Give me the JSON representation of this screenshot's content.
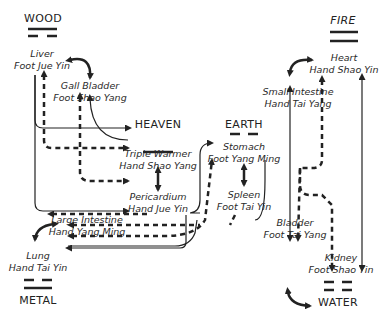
{
  "elements": {
    "wood": "WOOD",
    "fire": "FIRE",
    "heaven": "HEAVEN",
    "earth": "EARTH",
    "metal": "METAL",
    "water": "WATER"
  },
  "organs": {
    "liver": {
      "name": "Liver",
      "meridian": "Foot Jue Yin"
    },
    "gall_bladder": {
      "name": "Gall Bladder",
      "meridian": "Foot Shao Yang"
    },
    "triple_warmer": {
      "name": "Triple Warmer",
      "meridian": "Hand Shao Yang"
    },
    "pericardium": {
      "name": "Pericardium",
      "meridian": "Hand Jue Yin"
    },
    "stomach": {
      "name": "Stomach",
      "meridian": "Foot Yang Ming"
    },
    "spleen": {
      "name": "Spleen",
      "meridian": "Foot Tai Yin"
    },
    "large_intestine": {
      "name": "Large Intestine",
      "meridian": "Hand Yang Ming"
    },
    "lung": {
      "name": "Lung",
      "meridian": "Hand Tai Yin"
    },
    "heart": {
      "name": "Heart",
      "meridian": "Hand Shao Yin"
    },
    "small_intestine": {
      "name": "Small Intestine",
      "meridian": "Hand Tai Yang"
    },
    "bladder": {
      "name": "Bladder",
      "meridian": "Foot Tai Yang"
    },
    "kidney": {
      "name": "Kidney",
      "meridian": "Foot Shao Yin"
    }
  },
  "colors": {
    "line": "#222222",
    "background": "#ffffff"
  }
}
